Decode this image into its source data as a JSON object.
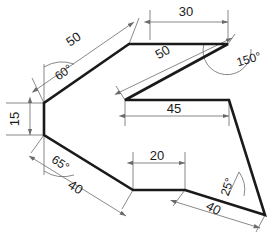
{
  "drawing": {
    "title": "Dimensioned polygon outline",
    "background_color": "#ffffff",
    "outline_color": "#1a1a1a",
    "dimension_color": "#6b6b6b",
    "text_color": "#1a1a1a",
    "outline_points": "129,44 44,103 44,135 133,190 185,190 265,215 229,100 125,100 228,44",
    "linear_dimensions": [
      {
        "id": "top-30",
        "label": "30",
        "x": 186,
        "y": 13,
        "rotation": 0
      },
      {
        "id": "upper-left-50",
        "label": "50",
        "x": 74,
        "y": 40,
        "rotation": -35
      },
      {
        "id": "inner-50",
        "label": "50",
        "x": 163,
        "y": 53,
        "rotation": -30
      },
      {
        "id": "left-15",
        "label": "15",
        "x": 16,
        "y": 119,
        "rotation": -90
      },
      {
        "id": "inner-45",
        "label": "45",
        "x": 174,
        "y": 115,
        "rotation": 0
      },
      {
        "id": "bottom-20",
        "label": "20",
        "x": 157,
        "y": 160,
        "rotation": 0
      },
      {
        "id": "lower-left-40",
        "label": "40",
        "x": 75,
        "y": 188,
        "rotation": 32
      },
      {
        "id": "lower-right-40",
        "label": "40",
        "x": 213,
        "y": 209,
        "rotation": 28
      }
    ],
    "angular_dimensions": [
      {
        "id": "angle-60",
        "label": "60°",
        "x": 64,
        "y": 73,
        "rotation": -35
      },
      {
        "id": "angle-150",
        "label": "150°",
        "x": 249,
        "y": 60,
        "rotation": -16
      },
      {
        "id": "angle-65",
        "label": "65°",
        "x": 60,
        "y": 164,
        "rotation": 34
      },
      {
        "id": "angle-25",
        "label": "25°",
        "x": 228,
        "y": 187,
        "rotation": -72
      }
    ]
  }
}
